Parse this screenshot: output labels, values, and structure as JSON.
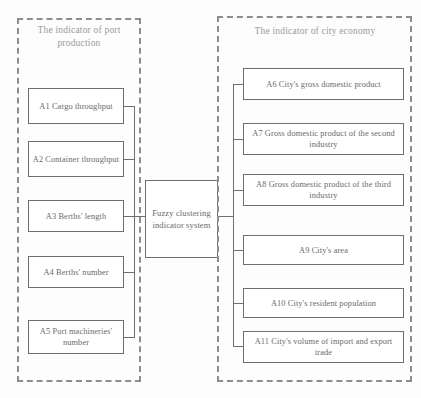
{
  "diagram": {
    "left_panel": {
      "title": "The indicator of port production",
      "nodes": [
        {
          "id": "A1",
          "label": "A1 Cargo throughput"
        },
        {
          "id": "A2",
          "label": "A2 Container throughput"
        },
        {
          "id": "A3",
          "label": "A3 Berths' length"
        },
        {
          "id": "A4",
          "label": "A4 Berths' number"
        },
        {
          "id": "A5",
          "label": "A5 Port machineries' number"
        }
      ]
    },
    "center": {
      "label": "Fuzzy clustering indicator system"
    },
    "right_panel": {
      "title": "The indicator of city economy",
      "nodes": [
        {
          "id": "A6",
          "label": "A6 City's gross domestic product"
        },
        {
          "id": "A7",
          "label": "A7 Gross domestic product of the second industry"
        },
        {
          "id": "A8",
          "label": "A8 Gross domestic product of the third industry"
        },
        {
          "id": "A9",
          "label": "A9  City's area"
        },
        {
          "id": "A10",
          "label": "A10  City's resident population"
        },
        {
          "id": "A11",
          "label": "A11  City's volume of import and export trade"
        }
      ]
    },
    "colors": {
      "box_border": "#6f6f6f",
      "panel_border": "#8d8d8d",
      "text": "#6a6a6a",
      "title_text": "#9a9a9a",
      "background": "#fdfdfd"
    }
  }
}
